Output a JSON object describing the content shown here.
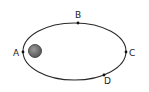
{
  "diagram": {
    "type": "elliptical-orbit",
    "orbit": {
      "cx": 74.5,
      "cy": 51.5,
      "rx": 51.5,
      "ry": 28.5,
      "stroke": "#2a2a2a"
    },
    "central_body": {
      "cx": 35,
      "cy": 51,
      "r": 6.5,
      "fill": "#6e6e6e",
      "stroke": "#333333"
    },
    "points": [
      {
        "label": "A",
        "x": 23,
        "y": 52,
        "lx": 13,
        "ly": 55.5
      },
      {
        "label": "B",
        "x": 78,
        "y": 23,
        "lx": 75,
        "ly": 18
      },
      {
        "label": "C",
        "x": 126,
        "y": 52,
        "lx": 129,
        "ly": 55.5
      },
      {
        "label": "D",
        "x": 104,
        "y": 75,
        "lx": 104,
        "ly": 84
      }
    ]
  }
}
